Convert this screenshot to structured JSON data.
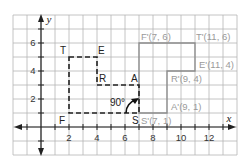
{
  "diagram": {
    "axes": {
      "x_label": "x",
      "y_label": "y",
      "x_ticks": [
        "2",
        "4",
        "6",
        "8",
        "10",
        "12"
      ],
      "y_ticks": [
        "2",
        "4",
        "6"
      ]
    },
    "preimage": {
      "style": "dashed",
      "vertices": [
        {
          "label": "T",
          "x": 2,
          "y": 5
        },
        {
          "label": "E",
          "x": 4,
          "y": 5
        },
        {
          "label": "R",
          "x": 4,
          "y": 3
        },
        {
          "label": "A",
          "x": 7,
          "y": 3
        },
        {
          "label": "S",
          "x": 7,
          "y": 1
        },
        {
          "label": "F",
          "x": 2,
          "y": 1
        }
      ]
    },
    "image": {
      "style": "solid-gray",
      "vertices": [
        {
          "label": "F'(7, 6)",
          "x": 7,
          "y": 6
        },
        {
          "label": "T'(11, 6)",
          "x": 11,
          "y": 6
        },
        {
          "label": "E'(11, 4)",
          "x": 11,
          "y": 4
        },
        {
          "label": "R'(9, 4)",
          "x": 9,
          "y": 4
        },
        {
          "label": "A'(9, 1)",
          "x": 9,
          "y": 1
        },
        {
          "label": "S'(7, 1)",
          "x": 7,
          "y": 1
        }
      ]
    },
    "rotation": {
      "angle_label": "90°",
      "center": "S"
    },
    "colors": {
      "preimage": "#222222",
      "image": "#8c8c8c",
      "grid": "#b5b5b5"
    }
  }
}
